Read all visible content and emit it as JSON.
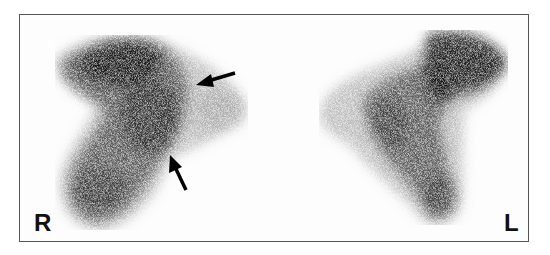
{
  "figure": {
    "type": "lung perfusion scintigraphy (posterior/anterior view pair)",
    "labels": {
      "right": "R",
      "left": "L"
    },
    "annotations": [
      {
        "name": "arrow-upper",
        "direction": "pointing left",
        "target": "right lung mid-zone defect"
      },
      {
        "name": "arrow-lower",
        "direction": "pointing up-left",
        "target": "right lung lower-zone defect"
      }
    ],
    "colors": {
      "background": "#ffffff",
      "frame": "#555555",
      "tracer": "#111111"
    }
  }
}
